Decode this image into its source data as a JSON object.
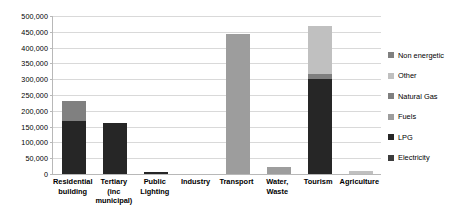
{
  "chart_data": {
    "type": "bar",
    "subtype": "stacked-bar",
    "title": "",
    "xlabel": "",
    "ylabel": "",
    "ylim": [
      0,
      500000
    ],
    "grid": true,
    "legend_position": "right",
    "categories": [
      "Residential building",
      "Tertiary (inc municipal)",
      "Public Lighting",
      "Industry",
      "Transport",
      "Water, Waste",
      "Tourism",
      "Agriculture"
    ],
    "y_ticks": [
      "0",
      "50,000",
      "100,000",
      "150,000",
      "200,000",
      "250,000",
      "300,000",
      "350,000",
      "400,000",
      "450,000",
      "500,000"
    ],
    "y_tick_values": [
      0,
      50000,
      100000,
      150000,
      200000,
      250000,
      300000,
      350000,
      400000,
      450000,
      500000
    ],
    "series": [
      {
        "name": "Electricity",
        "color": "#262626",
        "values": [
          168000,
          160000,
          6000,
          0,
          0,
          0,
          300000,
          0
        ]
      },
      {
        "name": "LPG",
        "color": "#4a4a4a",
        "values": [
          0,
          0,
          0,
          0,
          0,
          0,
          0,
          0
        ]
      },
      {
        "name": "Fuels",
        "color": "#9d9d9d",
        "values": [
          0,
          0,
          0,
          0,
          443000,
          22000,
          0,
          0
        ]
      },
      {
        "name": "Natural Gas",
        "color": "#7f7f7f",
        "values": [
          0,
          0,
          0,
          0,
          0,
          0,
          15000,
          0
        ]
      },
      {
        "name": "Other",
        "color": "#c0c0c0",
        "values": [
          0,
          0,
          0,
          0,
          0,
          0,
          155000,
          8000
        ]
      },
      {
        "name": "Non energetic",
        "color": "#808080",
        "values": [
          62000,
          0,
          0,
          0,
          0,
          0,
          0,
          0
        ]
      }
    ],
    "stack_order": [
      "Electricity",
      "LPG",
      "Fuels",
      "Natural Gas",
      "Other",
      "Non energetic"
    ],
    "totals": [
      230000,
      160000,
      6000,
      0,
      443000,
      22000,
      470000,
      8000
    ]
  },
  "legend": {
    "items": [
      {
        "label": "Non energetic",
        "color": "#808080"
      },
      {
        "label": "Other",
        "color": "#c0c0c0"
      },
      {
        "label": "Natural Gas",
        "color": "#7f7f7f"
      },
      {
        "label": "Fuels",
        "color": "#9d9d9d"
      },
      {
        "label": "LPG",
        "color": "#262626"
      },
      {
        "label": "Electricity",
        "color": "#3d3d3d"
      }
    ]
  },
  "colors": {
    "background": "#ffffff",
    "gridline": "#d9d9d9",
    "axis": "#b8b8b8",
    "text": "#000000"
  }
}
